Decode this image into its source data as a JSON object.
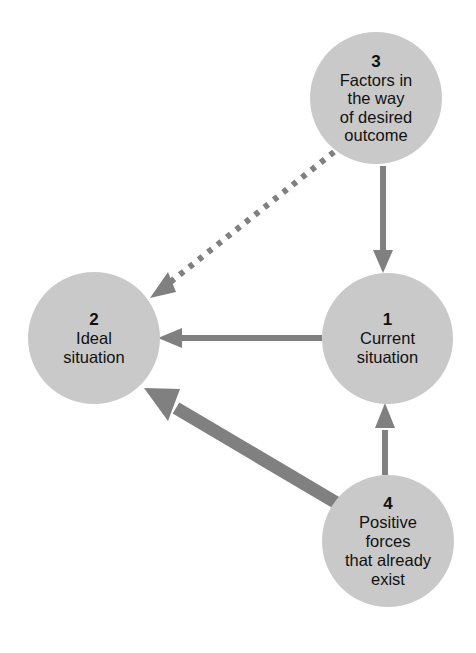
{
  "diagram": {
    "background_color": "#ffffff",
    "node_fill_color": "#c9c9c9",
    "arrow_color": "#808080",
    "text_color": "#111111",
    "nodes": [
      {
        "id": "node-1",
        "number": "1",
        "label": "Current\nsituation",
        "cx": 387,
        "cy": 338,
        "r": 65
      },
      {
        "id": "node-2",
        "number": "2",
        "label": "Ideal\nsituation",
        "cx": 94,
        "cy": 338,
        "r": 66
      },
      {
        "id": "node-3",
        "number": "3",
        "label": "Factors in\nthe way\nof desired\noutcome",
        "cx": 376,
        "cy": 98,
        "r": 66
      },
      {
        "id": "node-4",
        "number": "4",
        "label": "Positive\nforces\nthat already\nexist",
        "cx": 388,
        "cy": 541,
        "r": 66
      }
    ],
    "edges": [
      {
        "id": "edge-3-to-1",
        "from": "node-3",
        "to": "node-1",
        "style": "solid",
        "weight": "medium",
        "direction": "down"
      },
      {
        "id": "edge-1-to-2",
        "from": "node-1",
        "to": "node-2",
        "style": "solid",
        "weight": "medium",
        "direction": "left"
      },
      {
        "id": "edge-3-to-2",
        "from": "node-3",
        "to": "node-2",
        "style": "dotted",
        "weight": "medium",
        "direction": "down-left"
      },
      {
        "id": "edge-4-to-1",
        "from": "node-4",
        "to": "node-1",
        "style": "solid",
        "weight": "medium",
        "direction": "up"
      },
      {
        "id": "edge-4-to-2",
        "from": "node-4",
        "to": "node-2",
        "style": "solid",
        "weight": "thick",
        "direction": "up-left"
      }
    ]
  }
}
